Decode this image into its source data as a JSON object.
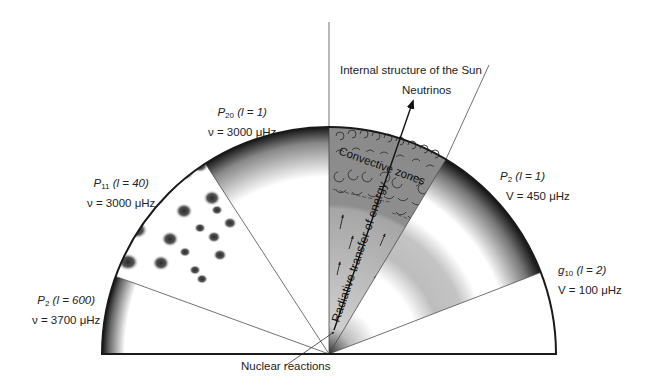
{
  "title": "Internal structure of the Sun",
  "labels": {
    "neutrinos": "Neutrinos",
    "nuclear_reactions": "Nuclear reactions",
    "convective_zones": "Convective zones",
    "radiative_transfer": "Radiative transfer of energy"
  },
  "modes": [
    {
      "id": "p2-l600",
      "name": "P",
      "sub": "2",
      "l": "(l = 600)",
      "freq": "ν = 3700 μHz"
    },
    {
      "id": "p11-l40",
      "name": "P",
      "sub": "11",
      "l": "(l = 40)",
      "freq": "ν = 3000 μHz"
    },
    {
      "id": "p20-l1",
      "name": "P",
      "sub": "20",
      "l": "(l = 1)",
      "freq": "ν = 3000 μHz"
    },
    {
      "id": "p2-l1",
      "name": "P",
      "sub": "2",
      "l": "(l = 1)",
      "freq": "V = 450 μHz"
    },
    {
      "id": "g10-l2",
      "name": "g",
      "sub": "10",
      "l": "(l = 2)",
      "freq": "V = 100 μHz"
    }
  ],
  "geometry": {
    "center": [
      329,
      354
    ],
    "radius": 227,
    "sector_boundaries_deg": [
      180,
      160,
      123,
      90,
      59,
      21,
      0
    ]
  },
  "colors": {
    "outline": "#1a1a1a",
    "convective_fill": "#8a8a8a",
    "radiative_fill": "#b4b4b4",
    "blob": "#3a3a3a"
  }
}
